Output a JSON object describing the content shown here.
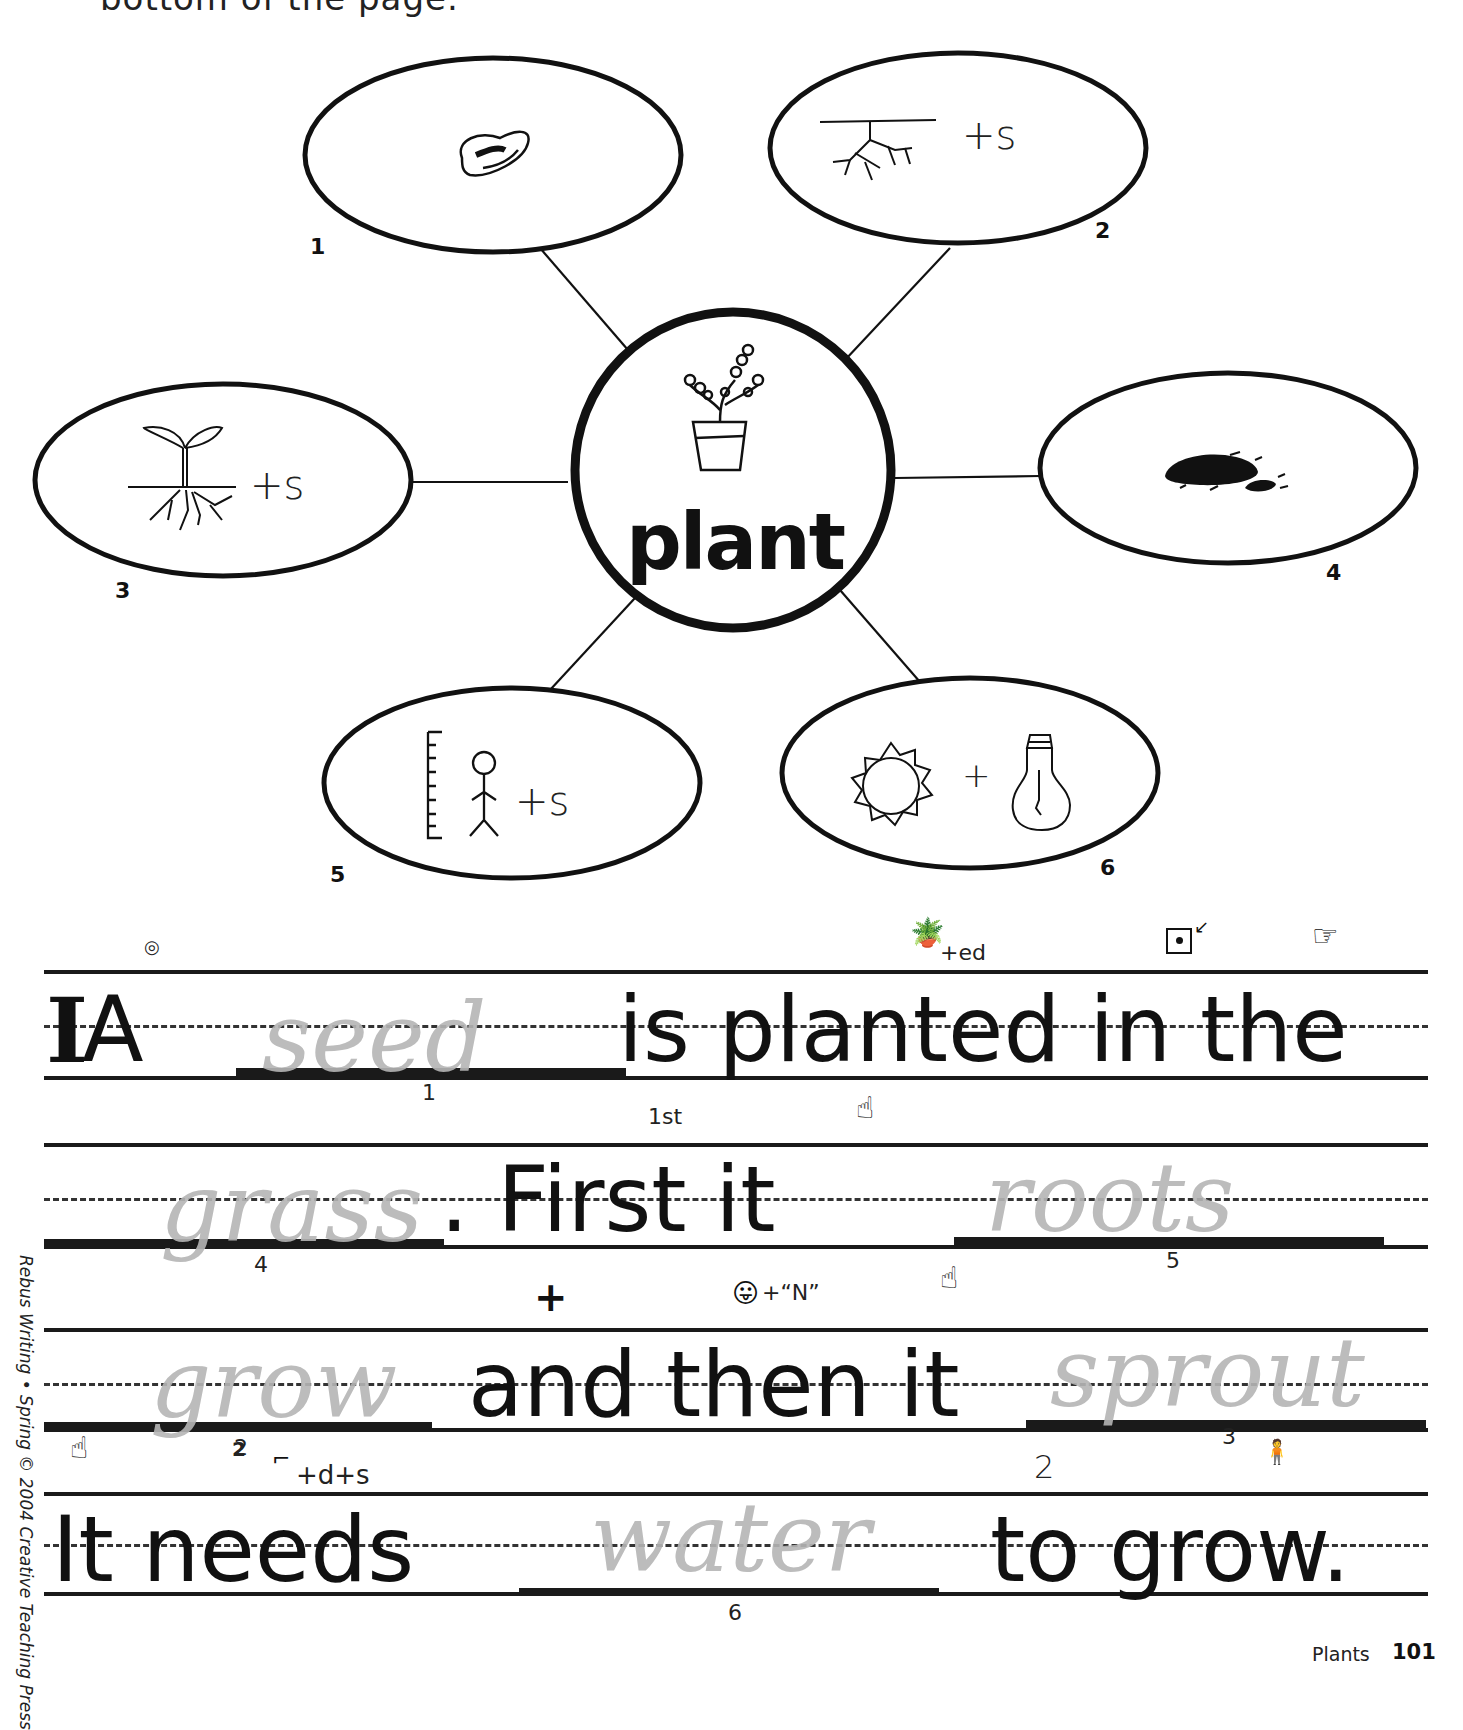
{
  "page": {
    "top_cut_text": "bottom of the page.",
    "sidebar_credit": "Rebus Writing • Spring © 2004 Creative Teaching Press",
    "footer": {
      "section": "Plants",
      "page_number": "101"
    }
  },
  "word_web": {
    "center": {
      "word": "plant",
      "icon": "potted-plant-icon"
    },
    "nodes": [
      {
        "number": "1",
        "icon": "seed-icon",
        "suffix": ""
      },
      {
        "number": "2",
        "icon": "roots-icon",
        "suffix": "+s"
      },
      {
        "number": "3",
        "icon": "sprout-icon",
        "suffix": "+s"
      },
      {
        "number": "4",
        "icon": "dirt-icon",
        "suffix": ""
      },
      {
        "number": "5",
        "icon": "ruler-person-icon",
        "suffix": "+s"
      },
      {
        "number": "6",
        "icon": "sun-icon",
        "plus": "+",
        "icon2": "light-bulb-icon"
      }
    ]
  },
  "sentences": [
    {
      "printed_start": "A",
      "handwritten": "seed",
      "blank_ref": "1",
      "printed_end": "is planted in the",
      "hints": [
        {
          "icon": "clock-icon",
          "text": ""
        },
        {
          "icon": "potted-plant-icon",
          "text": "+ed"
        },
        {
          "icon": "box-dot-arrow-icon",
          "text": ""
        },
        {
          "icon": "pointing-hand-icon",
          "text": ""
        }
      ]
    },
    {
      "handwritten_start": "grass",
      "blank_ref_start": "4",
      "printed": ". First it",
      "handwritten_end": "roots",
      "blank_ref_end": "5",
      "hints": [
        {
          "icon": "",
          "text": "1st"
        },
        {
          "icon": "hand-point-i-icon",
          "text": ""
        }
      ]
    },
    {
      "handwritten_start": "grow",
      "blank_ref_start": "2",
      "printed": "and then it",
      "handwritten_end": "sprout",
      "blank_ref_end": "3",
      "hints": [
        {
          "icon": "plus-icon",
          "text": "+"
        },
        {
          "icon": "tongue-face-icon",
          "text": "+“N”"
        },
        {
          "icon": "hand-point-i-icon",
          "text": ""
        }
      ]
    },
    {
      "printed_start": "It needs",
      "handwritten": "water",
      "blank_ref": "6",
      "printed_end": "to grow.",
      "hints": [
        {
          "icon": "hand-point-i-icon",
          "text": ""
        },
        {
          "icon": "",
          "text": "2"
        },
        {
          "icon": "bent-foot-icon",
          "text": "+d+s"
        },
        {
          "icon": "",
          "text": "2"
        },
        {
          "icon": "ruler-person-icon",
          "text": ""
        }
      ]
    }
  ]
}
